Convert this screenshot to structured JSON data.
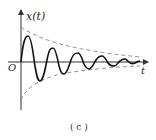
{
  "figure": {
    "y_axis_label": "x(t)",
    "x_axis_label": "t",
    "origin_label": "O",
    "caption": "( c )"
  },
  "curve": {
    "type": "damped-oscillation",
    "stroke": "#111111",
    "envelope_stroke": "#888888",
    "axis_stroke": "#333333"
  }
}
